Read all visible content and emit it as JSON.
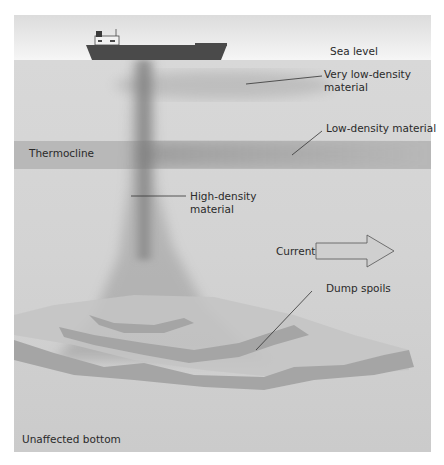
{
  "diagram": {
    "labels": {
      "sea_level": "Sea level",
      "very_low_density_1": "Very low-density",
      "very_low_density_2": "material",
      "low_density": "Low-density material",
      "thermocline": "Thermocline",
      "high_density_1": "High-density",
      "high_density_2": "material",
      "current": "Current",
      "dump_spoils": "Dump spoils",
      "unaffected_bottom": "Unaffected bottom"
    },
    "colors": {
      "sky": "#ffffff",
      "water": "#d9d9d9",
      "thermocline": "#b7b7b7",
      "plume": "#8a8a8a",
      "ship": "#4a4a4a",
      "arrow_fill": "#cfcfcf",
      "spoil_bands": "#a6a6a6"
    },
    "icons": [
      "ship-icon",
      "current-arrow-icon"
    ]
  }
}
